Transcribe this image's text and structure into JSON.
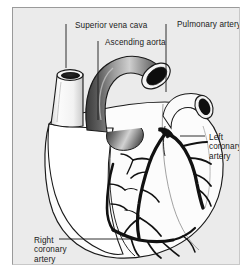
{
  "figure": {
    "panel_background": "#ebebeb",
    "line_color": "#1a1a1a"
  },
  "labels": {
    "superior_vena_cava": "Superior vena cava",
    "ascending_aorta": "Ascending aorta",
    "pulmonary_artery": "Pulmonary artery",
    "left_coronary_artery": "Left coronary artery",
    "right_coronary_artery": "Right coronary artery"
  },
  "structures": [
    {
      "name": "superior-vena-cava",
      "kind": "vessel-stump"
    },
    {
      "name": "ascending-aorta",
      "kind": "arched-vessel"
    },
    {
      "name": "pulmonary-artery",
      "kind": "vessel-stump"
    },
    {
      "name": "left-coronary-artery",
      "kind": "branching-vessel"
    },
    {
      "name": "right-coronary-artery",
      "kind": "branching-vessel"
    },
    {
      "name": "heart-body",
      "kind": "organ-outline"
    }
  ],
  "leader_lines": [
    {
      "for": "superior-vena-cava",
      "orientation": "vertical"
    },
    {
      "for": "ascending-aorta",
      "orientation": "vertical"
    },
    {
      "for": "pulmonary-artery",
      "orientation": "vertical"
    },
    {
      "for": "left-coronary-artery",
      "orientation": "horizontal"
    },
    {
      "for": "right-coronary-artery",
      "orientation": "horizontal"
    }
  ]
}
